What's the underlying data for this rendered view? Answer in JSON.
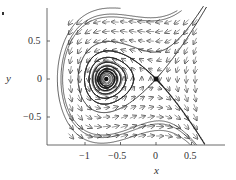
{
  "chart_data": {
    "type": "vector_field",
    "title": "",
    "xlabel": "x",
    "ylabel": "y",
    "xlim": [
      -1.3,
      0.7
    ],
    "ylim": [
      -0.87,
      0.93
    ],
    "grid": false,
    "legend": null,
    "x_ticks": [
      -1,
      -0.5,
      0,
      0.5
    ],
    "x_tick_labels": [
      "−1",
      "−0.5",
      "0",
      "0.5"
    ],
    "y_ticks": [
      0.5,
      0,
      -0.5
    ],
    "y_tick_labels": [
      "0.5",
      "0",
      "−0.5"
    ],
    "system": {
      "dx": "-y",
      "dy": "-x(1 + x/0.7) - 0.08y"
    },
    "fixed_points": [
      {
        "x": -0.7,
        "y": 0,
        "type": "stable spiral"
      },
      {
        "x": 0,
        "y": 0,
        "type": "saddle"
      }
    ],
    "arrow_grid": {
      "x_start": -1.2,
      "x_end": 0.65,
      "x_step": 0.125,
      "y_start": -0.75,
      "y_end": 0.82,
      "y_step": 0.125
    },
    "streamlines": "homoclinic loop around spiral at (-0.7,0) through saddle at (0,0), with outer trajectories and stable/unstable manifolds"
  },
  "axes": {
    "x_label": "x",
    "y_label": "y",
    "x_tick_labels": [
      "−1",
      "−0.5",
      "0",
      "0.5"
    ],
    "y_tick_labels": [
      "0.5",
      "0",
      "−0.5"
    ]
  },
  "colors": {
    "ink": "#333333",
    "arrow": "#555555",
    "curve": "#222222"
  }
}
